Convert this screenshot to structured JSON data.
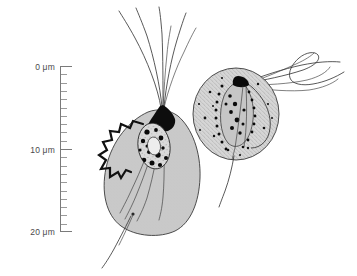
{
  "figure": {
    "background_color": "#ffffff",
    "width": 357,
    "height": 276
  },
  "scale_bar": {
    "name": "scale-bar",
    "unit": "μm",
    "axis_x": 60,
    "top_y": 66,
    "bottom_y": 232,
    "minor_tick_interval_um": 1,
    "major_tick_length": 11,
    "minor_tick_length": 6,
    "labels": [
      {
        "text": "0 μm",
        "value": 0,
        "y": 66
      },
      {
        "text": "10 μm",
        "value": 10,
        "y": 149
      },
      {
        "text": "20 μm",
        "value": 20,
        "y": 232
      }
    ]
  },
  "cells": [
    {
      "name": "left-cell",
      "label": "Pyriform flagellate cell",
      "body_shape": "teardrop",
      "body_fill": "#c9c9c9",
      "body_stroke": "#3a3a3a",
      "apex_fill": "#0d0d0d",
      "nucleus_fill": "#d8d8d8",
      "granule_color": "#0a0a0a",
      "anterior_flagella_count": 6,
      "posterior_flagella_count": 1,
      "has_collar": true,
      "collar_color": "#111111"
    },
    {
      "name": "right-cell",
      "label": "Rounded stippled flagellate cell",
      "body_shape": "round",
      "body_fill": "#d2d2d2",
      "body_stroke": "#3a3a3a",
      "stipple_color": "#555555",
      "granule_color": "#0a0a0a",
      "anterior_flagella_count": 5,
      "posterior_flagella_count": 1,
      "has_collar": false,
      "organelle_fill": "#c2c2c2"
    }
  ]
}
